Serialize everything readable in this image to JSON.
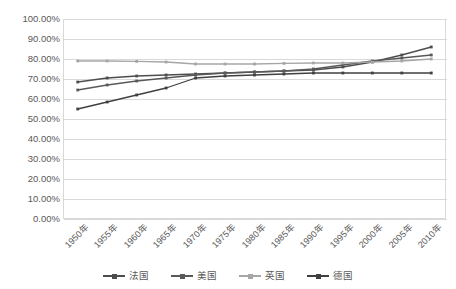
{
  "chart_data": {
    "type": "line",
    "title": "",
    "subtitle": "",
    "xlabel": "",
    "ylabel": "",
    "categories": [
      "1950年",
      "1955年",
      "1960年",
      "1965年",
      "1970年",
      "1975年",
      "1980年",
      "1985年",
      "1990年",
      "1995年",
      "2000年",
      "2005年",
      "2010年"
    ],
    "ylim": [
      0,
      100
    ],
    "ytick_step": 10,
    "ytick_labels": [
      "0.00%",
      "10.00%",
      "20.00%",
      "30.00%",
      "40.00%",
      "50.00%",
      "60.00%",
      "70.00%",
      "80.00%",
      "90.00%",
      "100.00%"
    ],
    "ytick_values": [
      0,
      10,
      20,
      30,
      40,
      50,
      60,
      70,
      80,
      90,
      100
    ],
    "grid": true,
    "grid_axis": "y",
    "legend_position": "bottom",
    "value_unit": "%",
    "series": [
      {
        "name": "法国",
        "color": "#4d4d4d",
        "marker": "square",
        "values": [
          68.5,
          70.5,
          71.5,
          72.0,
          72.5,
          73.0,
          73.5,
          74.0,
          74.5,
          76.0,
          78.5,
          82.0,
          86.0
        ]
      },
      {
        "name": "美国",
        "color": "#595959",
        "marker": "square",
        "values": [
          64.5,
          67.0,
          69.0,
          70.5,
          72.0,
          73.0,
          73.5,
          74.0,
          75.0,
          77.0,
          79.0,
          80.5,
          82.0
        ]
      },
      {
        "name": "英国",
        "color": "#a6a6a6",
        "marker": "square",
        "values": [
          79.0,
          79.0,
          78.8,
          78.5,
          77.5,
          77.5,
          77.5,
          77.8,
          78.0,
          78.0,
          78.5,
          79.0,
          80.0
        ]
      },
      {
        "name": "德国",
        "color": "#404040",
        "marker": "square",
        "values": [
          55.0,
          58.5,
          62.0,
          65.5,
          70.5,
          71.5,
          72.0,
          72.5,
          73.0,
          73.0,
          73.0,
          73.0,
          73.0
        ]
      }
    ]
  },
  "legend": {
    "items": [
      {
        "label": "法国"
      },
      {
        "label": "美国"
      },
      {
        "label": "英国"
      },
      {
        "label": "德国"
      }
    ]
  },
  "colors": {
    "gridline": "#d9d9d9",
    "axis_text": "#595959",
    "plot_background": "#ffffff",
    "series_1": "#4d4d4d",
    "series_2": "#595959",
    "series_3": "#a6a6a6",
    "series_4": "#404040"
  }
}
